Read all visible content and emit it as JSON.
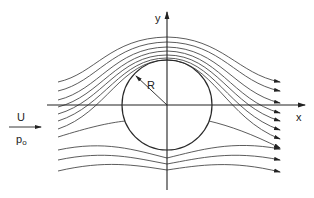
{
  "diagram": {
    "axes": {
      "x_label": "x",
      "y_label": "y"
    },
    "cylinder": {
      "radius_label": "R"
    },
    "freestream": {
      "velocity_label": "U",
      "pressure_label": "p",
      "pressure_subscript": "o"
    },
    "colors": {
      "line": "#4a4a4a",
      "axis": "#222222",
      "background": "#ffffff"
    },
    "streamlines_upper_count": 8,
    "streamlines_lower_count": 3
  }
}
